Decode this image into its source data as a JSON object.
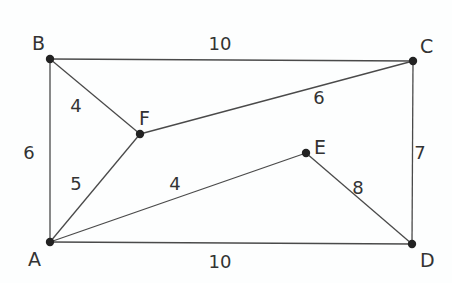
{
  "diagram": {
    "type": "weighted-graph",
    "nodes": [
      {
        "id": "A",
        "label": "A",
        "x": 50,
        "y": 242,
        "lx": 28,
        "ly": 266
      },
      {
        "id": "B",
        "label": "B",
        "x": 50,
        "y": 59,
        "lx": 32,
        "ly": 50
      },
      {
        "id": "C",
        "label": "C",
        "x": 413,
        "y": 61,
        "lx": 420,
        "ly": 53
      },
      {
        "id": "D",
        "label": "D",
        "x": 412,
        "y": 244,
        "lx": 420,
        "ly": 267
      },
      {
        "id": "E",
        "label": "E",
        "x": 306,
        "y": 153,
        "lx": 314,
        "ly": 154
      },
      {
        "id": "F",
        "label": "F",
        "x": 140,
        "y": 134,
        "lx": 139,
        "ly": 125
      }
    ],
    "edges": [
      {
        "from": "B",
        "to": "C",
        "weight": "10",
        "wx": 220,
        "wy": 50
      },
      {
        "from": "B",
        "to": "F",
        "weight": "4",
        "wx": 76,
        "wy": 112
      },
      {
        "from": "F",
        "to": "C",
        "weight": "6",
        "wx": 319,
        "wy": 104
      },
      {
        "from": "B",
        "to": "A",
        "weight": "6",
        "wx": 29,
        "wy": 159
      },
      {
        "from": "C",
        "to": "D",
        "weight": "7",
        "wx": 420,
        "wy": 159
      },
      {
        "from": "F",
        "to": "A",
        "weight": "5",
        "wx": 76,
        "wy": 190
      },
      {
        "from": "A",
        "to": "E",
        "weight": "4",
        "wx": 175,
        "wy": 190
      },
      {
        "from": "E",
        "to": "D",
        "weight": "8",
        "wx": 358,
        "wy": 194
      },
      {
        "from": "A",
        "to": "D",
        "weight": "10",
        "wx": 220,
        "wy": 268
      }
    ]
  }
}
